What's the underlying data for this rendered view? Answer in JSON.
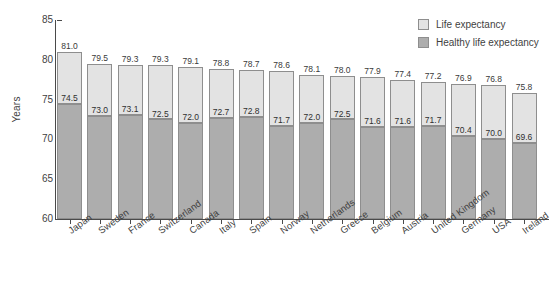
{
  "chart_data": {
    "type": "bar",
    "subtype": "stacked-overlay",
    "title": "",
    "xlabel": "",
    "ylabel": "Years",
    "ylim": [
      60,
      85
    ],
    "yticks": [
      60,
      65,
      70,
      75,
      80,
      85
    ],
    "grid": false,
    "legend_position": "top-right",
    "categories": [
      "Japan",
      "Sweden",
      "France",
      "Switzerland",
      "Canada",
      "Italy",
      "Spain",
      "Norway",
      "Netherlands",
      "Greece",
      "Belgium",
      "Austria",
      "United Kingdom",
      "Germany",
      "USA",
      "Ireland"
    ],
    "series": [
      {
        "name": "Life expectancy",
        "color": "#e3e3e3",
        "values": [
          81.0,
          79.5,
          79.3,
          79.3,
          79.1,
          78.8,
          78.7,
          78.6,
          78.1,
          78.0,
          77.9,
          77.4,
          77.2,
          76.9,
          76.8,
          75.8
        ]
      },
      {
        "name": "Healthy life expectancy",
        "color": "#adadad",
        "values": [
          74.5,
          73.0,
          73.1,
          72.5,
          72.0,
          72.7,
          72.8,
          71.7,
          72.0,
          72.5,
          71.6,
          71.6,
          71.7,
          70.4,
          70.0,
          69.6
        ]
      }
    ],
    "value_labels": {
      "life": [
        "81.0",
        "79.5",
        "79.3",
        "79.3",
        "79.1",
        "78.8",
        "78.7",
        "78.6",
        "78.1",
        "78.0",
        "77.9",
        "77.4",
        "77.2",
        "76.9",
        "76.8",
        "75.8"
      ],
      "healthy": [
        "74.5",
        "73.0",
        "73.1",
        "72.5",
        "72.0",
        "72.7",
        "72.8",
        "71.7",
        "72.0",
        "72.5",
        "71.6",
        "71.6",
        "71.7",
        "70.4",
        "70.0",
        "69.6"
      ]
    },
    "ytick_labels": [
      "85",
      "80",
      "75",
      "70",
      "65",
      "60"
    ]
  },
  "legend": {
    "items": [
      {
        "label": "Life expectancy",
        "swatch": "life"
      },
      {
        "label": "Healthy life expectancy",
        "swatch": "healthy"
      }
    ]
  },
  "axis": {
    "y_title": "Years"
  }
}
